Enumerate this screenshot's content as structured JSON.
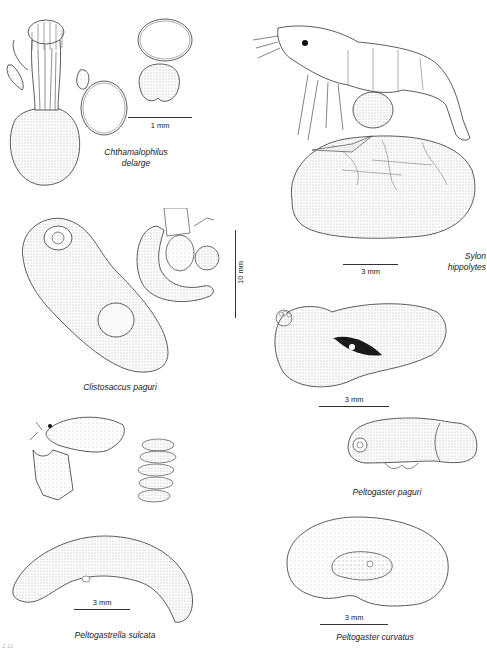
{
  "plate": {
    "figure_number": "2.11",
    "colors": {
      "ink": "#1a1a1a",
      "stipple": "#555555",
      "background": "#ffffff"
    }
  },
  "specimens": [
    {
      "id": "chthamalophilus",
      "name_line1": "Chthamalophilus",
      "name_line2": "delarge",
      "scale": "1 mm"
    },
    {
      "id": "sylon",
      "name_line1": "Sylon",
      "name_line2": "hippolytes",
      "scale": "3 mm"
    },
    {
      "id": "clistosaccus",
      "name_line1": "Clistosaccus paguri",
      "name_line2": "",
      "scale": "10 mm"
    },
    {
      "id": "peltogaster-paguri",
      "name_line1": "Peltogaster paguri",
      "name_line2": "",
      "scale": "3 mm"
    },
    {
      "id": "peltogastrella",
      "name_line1": "Peltogastrella sulcata",
      "name_line2": "",
      "scale": "3 mm"
    },
    {
      "id": "peltogaster-curvatus",
      "name_line1": "Peltogaster curvatus",
      "name_line2": "",
      "scale": "3 mm"
    }
  ]
}
